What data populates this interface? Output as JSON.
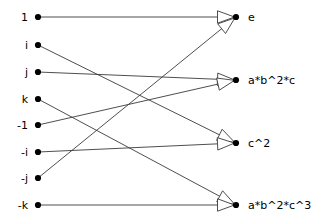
{
  "diagram": {
    "type": "bipartite-mapping-graph",
    "background_color": "#ffffff",
    "node_color": "#000000",
    "edge_color": "#3a3a3a",
    "arrow_style": "open-triangle",
    "left_nodes": [
      {
        "id": "L0",
        "label": "1",
        "x": 38,
        "y": 17
      },
      {
        "id": "L1",
        "label": "i",
        "x": 38,
        "y": 45
      },
      {
        "id": "L2",
        "label": "j",
        "x": 38,
        "y": 72
      },
      {
        "id": "L3",
        "label": "k",
        "x": 38,
        "y": 99
      },
      {
        "id": "L4",
        "label": "-1",
        "x": 38,
        "y": 125
      },
      {
        "id": "L5",
        "label": "-i",
        "x": 38,
        "y": 152
      },
      {
        "id": "L6",
        "label": "-j",
        "x": 38,
        "y": 178
      },
      {
        "id": "L7",
        "label": "-k",
        "x": 38,
        "y": 205
      }
    ],
    "right_nodes": [
      {
        "id": "R0",
        "label": "e",
        "x": 236,
        "y": 17
      },
      {
        "id": "R1",
        "label": "a*b^2*c",
        "x": 236,
        "y": 80
      },
      {
        "id": "R2",
        "label": "c^2",
        "x": 236,
        "y": 143
      },
      {
        "id": "R3",
        "label": "a*b^2*c^3",
        "x": 236,
        "y": 205
      }
    ],
    "edges": [
      {
        "from": "L0",
        "to": "R0"
      },
      {
        "from": "L1",
        "to": "R2"
      },
      {
        "from": "L2",
        "to": "R1"
      },
      {
        "from": "L3",
        "to": "R3"
      },
      {
        "from": "L4",
        "to": "R1"
      },
      {
        "from": "L5",
        "to": "R2"
      },
      {
        "from": "L6",
        "to": "R0"
      },
      {
        "from": "L7",
        "to": "R3"
      }
    ]
  }
}
